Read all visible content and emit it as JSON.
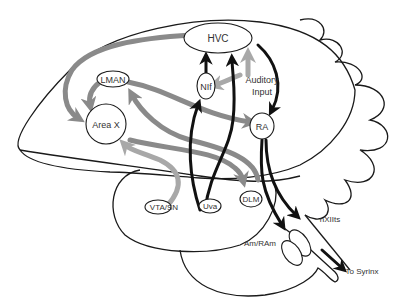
{
  "diagram": {
    "type": "songbird brain song-system circuit",
    "colors": {
      "outline": "#1a1a1a",
      "pathway_gray": "#8a8a8a",
      "pathway_light_gray": "#a8a8a8",
      "pathway_dark": "#111111",
      "text": "#333333",
      "background": "#ffffff"
    },
    "nodes": {
      "hvc": {
        "label": "HVC"
      },
      "nif": {
        "label": "NIf"
      },
      "auditory": {
        "label_line1": "Auditory",
        "label_line2": "Input"
      },
      "lman": {
        "label": "LMAN"
      },
      "area_x": {
        "label": "Area X"
      },
      "ra": {
        "label": "RA"
      },
      "vta_sn": {
        "label": "VTA/SN"
      },
      "uva": {
        "label": "Uva"
      },
      "dlm": {
        "label": "DLM"
      },
      "nxiits": {
        "label": "nXIIts"
      },
      "am_ram": {
        "label": "Am/RAm"
      },
      "syrinx": {
        "label": "To Syrinx"
      }
    },
    "connections": [
      {
        "from": "HVC",
        "to": "Area X",
        "style": "gray"
      },
      {
        "from": "Area X",
        "to": "DLM",
        "style": "gray"
      },
      {
        "from": "DLM",
        "to": "LMAN",
        "style": "gray"
      },
      {
        "from": "LMAN",
        "to": "Area X",
        "style": "gray"
      },
      {
        "from": "LMAN",
        "to": "RA",
        "style": "gray"
      },
      {
        "from": "VTA/SN",
        "to": "Area X",
        "style": "light-gray"
      },
      {
        "from": "Auditory Input",
        "to": "HVC",
        "style": "light-gray"
      },
      {
        "from": "Auditory Input",
        "to": "NIf",
        "style": "light-gray"
      },
      {
        "from": "NIf",
        "to": "HVC",
        "style": "dark"
      },
      {
        "from": "Uva",
        "to": "NIf",
        "style": "dark"
      },
      {
        "from": "Uva",
        "to": "HVC",
        "style": "dark"
      },
      {
        "from": "HVC",
        "to": "RA",
        "style": "dark"
      },
      {
        "from": "RA",
        "to": "nXIIts",
        "style": "dark"
      },
      {
        "from": "RA",
        "to": "Am/RAm",
        "style": "dark"
      },
      {
        "from": "nXIIts",
        "to": "To Syrinx",
        "style": "dark"
      }
    ]
  }
}
